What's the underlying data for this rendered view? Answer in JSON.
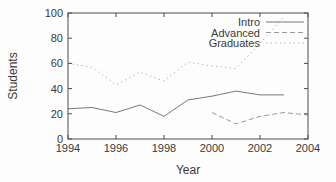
{
  "colors": {
    "background": "#fdfdfd",
    "border": "#4d4d4d",
    "text": "#3a3a3a",
    "intro_line": "#787878",
    "advanced_line": "#999999",
    "graduates_line": "#a8a8a8"
  },
  "chart_data": {
    "type": "line",
    "xlabel": "Year",
    "ylabel": "Students",
    "xlim": [
      1994,
      2004
    ],
    "ylim": [
      0,
      100
    ],
    "xticks": [
      1994,
      1996,
      1998,
      2000,
      2002,
      2004
    ],
    "yticks": [
      0,
      20,
      40,
      60,
      80,
      100
    ],
    "grid": false,
    "legend_position": "top-right-inside",
    "series": [
      {
        "name": "Intro",
        "style": "solid",
        "color": "#787878",
        "x": [
          1994,
          1995,
          1996,
          1997,
          1998,
          1999,
          2000,
          2001,
          2002,
          2003
        ],
        "y": [
          24,
          25,
          21,
          27,
          18,
          31,
          34,
          38,
          35,
          35
        ]
      },
      {
        "name": "Advanced",
        "style": "dashed",
        "color": "#999999",
        "x": [
          2000,
          2001,
          2002,
          2003,
          2004
        ],
        "y": [
          21,
          12,
          18,
          21,
          19
        ]
      },
      {
        "name": "Graduates",
        "style": "dotted",
        "color": "#a8a8a8",
        "x": [
          1994,
          1995,
          1996,
          1997,
          1998,
          1999,
          2000,
          2001,
          2002,
          2003
        ],
        "y": [
          60,
          57,
          43,
          53,
          46,
          61,
          58,
          56,
          76,
          97
        ]
      }
    ]
  }
}
